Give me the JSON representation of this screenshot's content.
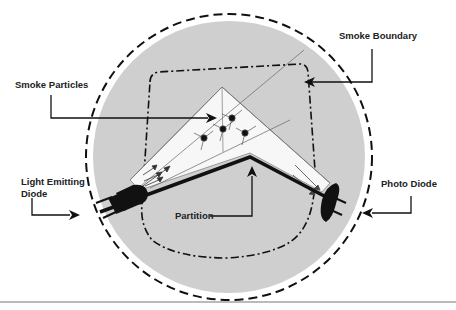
{
  "diagram": {
    "colors": {
      "chamber_fill": "#cfcfcf",
      "wedge_fill": "#f7f7f7",
      "line": "#111111",
      "background": "#ffffff"
    },
    "labels": {
      "smoke_particles": "Smoke Particles",
      "smoke_boundary": "Smoke Boundary",
      "led_line1": "Light Emitting",
      "led_line2": "Diode",
      "partition": "Partition",
      "photo_diode": "Photo Diode"
    },
    "components": [
      "chamber",
      "smoke-boundary",
      "light-emitting-diode",
      "photo-diode",
      "partition",
      "smoke-particles",
      "light-beam"
    ],
    "particle_count": 4
  }
}
